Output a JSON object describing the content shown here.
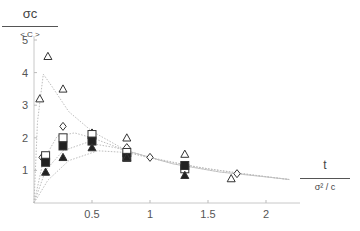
{
  "chart_data": {
    "type": "scatter",
    "title": "",
    "ylabel": {
      "numerator": "σc",
      "denominator": "< C >"
    },
    "xlabel": {
      "numerator": "t",
      "denominator": "σ² / c"
    },
    "xlim": [
      0,
      2.3
    ],
    "ylim": [
      0,
      5.2
    ],
    "x_ticks": [
      0.5,
      1,
      1.5,
      2
    ],
    "x_tick_labels": [
      "0.5",
      "1",
      "1.5",
      "2"
    ],
    "y_ticks": [
      1,
      2,
      3,
      4,
      5
    ],
    "y_tick_labels": [
      "1",
      "2",
      "3",
      "4",
      "5"
    ],
    "grid": false,
    "legend": null,
    "series": [
      {
        "name": "open-triangle",
        "marker": "triangle-open",
        "points": [
          [
            0.05,
            3.2
          ],
          [
            0.12,
            4.5
          ],
          [
            0.25,
            3.5
          ],
          [
            0.8,
            2.0
          ],
          [
            1.3,
            1.5
          ],
          [
            1.7,
            0.75
          ]
        ]
      },
      {
        "name": "diamond",
        "marker": "diamond-open",
        "points": [
          [
            0.07,
            1.4
          ],
          [
            0.25,
            2.35
          ],
          [
            0.5,
            2.15
          ],
          [
            0.8,
            1.7
          ],
          [
            1.0,
            1.4
          ],
          [
            1.75,
            0.9
          ]
        ]
      },
      {
        "name": "open-square",
        "marker": "square-open",
        "points": [
          [
            0.1,
            1.45
          ],
          [
            0.25,
            2.0
          ],
          [
            0.5,
            2.1
          ],
          [
            0.8,
            1.55
          ],
          [
            1.3,
            1.05
          ]
        ]
      },
      {
        "name": "filled-square",
        "marker": "square-filled",
        "points": [
          [
            0.1,
            1.25
          ],
          [
            0.25,
            1.75
          ],
          [
            0.5,
            1.9
          ],
          [
            0.8,
            1.4
          ],
          [
            1.3,
            1.15
          ]
        ]
      },
      {
        "name": "filled-triangle",
        "marker": "triangle-filled",
        "points": [
          [
            0.1,
            0.95
          ],
          [
            0.25,
            1.4
          ],
          [
            0.5,
            1.7
          ],
          [
            0.8,
            1.4
          ],
          [
            1.3,
            0.85
          ]
        ]
      }
    ],
    "curves": [
      {
        "name": "curve-1",
        "style": "dotted",
        "points": [
          [
            0.0,
            0.0
          ],
          [
            0.03,
            2.5
          ],
          [
            0.08,
            3.95
          ],
          [
            0.15,
            3.6
          ],
          [
            0.3,
            2.8
          ],
          [
            0.5,
            2.2
          ],
          [
            0.8,
            1.6
          ],
          [
            1.2,
            1.2
          ],
          [
            1.6,
            0.95
          ],
          [
            2.0,
            0.8
          ],
          [
            2.2,
            0.72
          ]
        ]
      },
      {
        "name": "curve-2",
        "style": "dotted",
        "points": [
          [
            0.0,
            0.0
          ],
          [
            0.08,
            1.3
          ],
          [
            0.2,
            2.05
          ],
          [
            0.35,
            2.15
          ],
          [
            0.5,
            2.0
          ],
          [
            0.8,
            1.6
          ],
          [
            1.2,
            1.2
          ],
          [
            1.6,
            0.95
          ],
          [
            2.0,
            0.8
          ],
          [
            2.2,
            0.72
          ]
        ]
      },
      {
        "name": "curve-3",
        "style": "dotted",
        "points": [
          [
            0.0,
            0.0
          ],
          [
            0.1,
            1.0
          ],
          [
            0.25,
            1.6
          ],
          [
            0.45,
            1.85
          ],
          [
            0.7,
            1.7
          ],
          [
            1.0,
            1.4
          ],
          [
            1.4,
            1.1
          ],
          [
            1.8,
            0.9
          ],
          [
            2.2,
            0.72
          ]
        ]
      },
      {
        "name": "curve-4",
        "style": "dotted",
        "points": [
          [
            0.0,
            0.0
          ],
          [
            0.12,
            0.7
          ],
          [
            0.3,
            1.3
          ],
          [
            0.55,
            1.6
          ],
          [
            0.8,
            1.55
          ],
          [
            1.1,
            1.3
          ],
          [
            1.5,
            1.05
          ],
          [
            1.9,
            0.85
          ],
          [
            2.2,
            0.72
          ]
        ]
      }
    ]
  },
  "labels": {
    "y_num": "σc",
    "y_den": "< C >",
    "x_num": "t",
    "x_den": "σ² / c"
  }
}
